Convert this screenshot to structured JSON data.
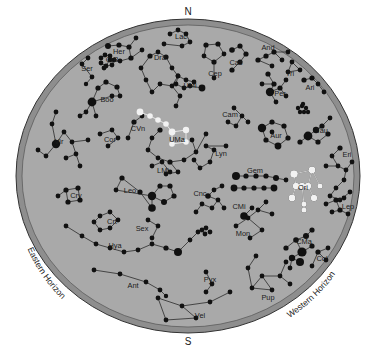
{
  "figure": {
    "type": "sky-map",
    "title": "",
    "background_color": "#ffffff",
    "sky_fill": "#a9a9a9",
    "rim_fill": "#8e8e8e",
    "rim_stroke": "#3a3a3a",
    "star_color": "#111111",
    "highlight_star_color": "#f2f2f2",
    "line_color": "#2b2b2b",
    "label_color": "#1a1a1a"
  },
  "cardinals": {
    "north": "N",
    "south": "S"
  },
  "horizons": {
    "east": "Eastern Horizon",
    "west": "Western Horizon"
  },
  "chart_data": {
    "type": "scatter",
    "xlabel": "",
    "ylabel": "",
    "grid": false,
    "legend": "none",
    "projection": "horizon-circle",
    "center": [
      188,
      176
    ],
    "radius_x": 172,
    "radius_y": 157,
    "constellation_labels": [
      {
        "abbr": "Lac",
        "x": 181,
        "y": 39
      },
      {
        "abbr": "Her",
        "x": 119,
        "y": 54
      },
      {
        "abbr": "CrB",
        "x": 112,
        "y": 62
      },
      {
        "abbr": "Ser",
        "x": 87,
        "y": 71
      },
      {
        "abbr": "Dra",
        "x": 160,
        "y": 60
      },
      {
        "abbr": "Cep",
        "x": 215,
        "y": 76
      },
      {
        "abbr": "Cas",
        "x": 236,
        "y": 65
      },
      {
        "abbr": "And",
        "x": 268,
        "y": 50
      },
      {
        "abbr": "Tri",
        "x": 290,
        "y": 76
      },
      {
        "abbr": "Per",
        "x": 280,
        "y": 96
      },
      {
        "abbr": "Ari",
        "x": 310,
        "y": 90
      },
      {
        "abbr": "UMi",
        "x": 190,
        "y": 88
      },
      {
        "abbr": "Boo",
        "x": 107,
        "y": 102
      },
      {
        "abbr": "Cam",
        "x": 230,
        "y": 117
      },
      {
        "abbr": "Aur",
        "x": 276,
        "y": 138
      },
      {
        "abbr": "Tau",
        "x": 322,
        "y": 133
      },
      {
        "abbr": "CVn",
        "x": 138,
        "y": 131
      },
      {
        "abbr": "Cor",
        "x": 110,
        "y": 142
      },
      {
        "abbr": "UMa",
        "x": 177,
        "y": 142
      },
      {
        "abbr": "Vir",
        "x": 59,
        "y": 144
      },
      {
        "abbr": "Eri",
        "x": 347,
        "y": 157
      },
      {
        "abbr": "Lyn",
        "x": 221,
        "y": 156
      },
      {
        "abbr": "LMi",
        "x": 163,
        "y": 173
      },
      {
        "abbr": "Gem",
        "x": 255,
        "y": 173
      },
      {
        "abbr": "Leo",
        "x": 130,
        "y": 193
      },
      {
        "abbr": "Ori",
        "x": 303,
        "y": 190
      },
      {
        "abbr": "Cnc",
        "x": 200,
        "y": 196
      },
      {
        "abbr": "Crv",
        "x": 76,
        "y": 198
      },
      {
        "abbr": "CMi",
        "x": 239,
        "y": 209
      },
      {
        "abbr": "Lep",
        "x": 348,
        "y": 209
      },
      {
        "abbr": "Crt",
        "x": 112,
        "y": 224
      },
      {
        "abbr": "Sex",
        "x": 142,
        "y": 231
      },
      {
        "abbr": "Mon",
        "x": 243,
        "y": 236
      },
      {
        "abbr": "Hya",
        "x": 115,
        "y": 248
      },
      {
        "abbr": "CMa",
        "x": 304,
        "y": 244
      },
      {
        "abbr": "Col",
        "x": 322,
        "y": 261
      },
      {
        "abbr": "Ant",
        "x": 133,
        "y": 288
      },
      {
        "abbr": "Pyx",
        "x": 210,
        "y": 282
      },
      {
        "abbr": "Pup",
        "x": 268,
        "y": 300
      },
      {
        "abbr": "Vel",
        "x": 200,
        "y": 318
      }
    ],
    "highlighted_asterisms": [
      {
        "name": "Big Dipper (UMa)",
        "color": "#f2f2f2"
      },
      {
        "name": "Orion (Ori)",
        "color": "#f2f2f2"
      }
    ],
    "star_magnitude_sizes": {
      "bright": 4.6,
      "medium": 3.2,
      "faint": 2.2
    }
  }
}
